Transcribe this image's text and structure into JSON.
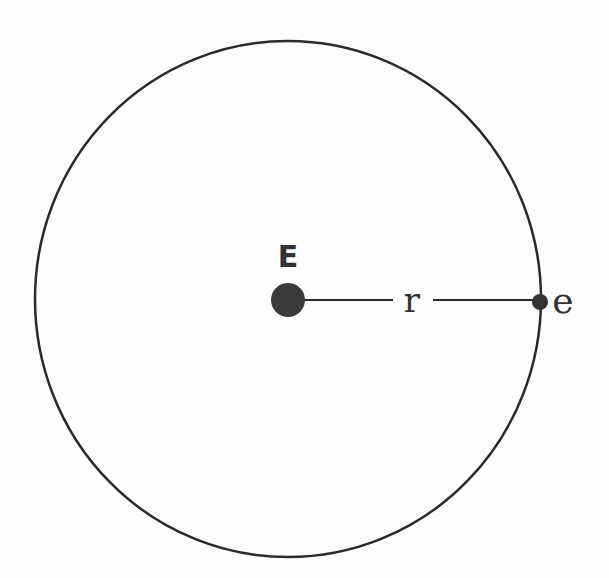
{
  "diagram": {
    "type": "orbit",
    "nucleus_label": "E",
    "radius_label": "r",
    "electron_label": "e",
    "colors": {
      "stroke": "#2a2a2a",
      "nucleus": "#3a3a3a",
      "background": "#fdfdfd"
    }
  }
}
